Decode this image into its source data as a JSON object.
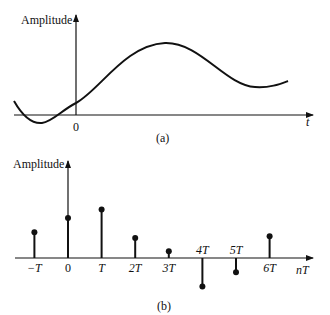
{
  "figure_a": {
    "y_axis_label": "Amplitude",
    "x_axis_label": "t",
    "origin_label": "0",
    "caption": "(a)",
    "description": "continuous-time analog signal"
  },
  "figure_b": {
    "y_axis_label": "Amplitude",
    "x_axis_label": "nT",
    "caption": "(b)",
    "description": "sampled discrete-time signal",
    "samples": [
      {
        "label": "−T",
        "n": -1,
        "value": 0.45
      },
      {
        "label": "0",
        "n": 0,
        "value": 0.7
      },
      {
        "label": "T",
        "n": 1,
        "value": 0.85
      },
      {
        "label": "2T",
        "n": 2,
        "value": 0.35
      },
      {
        "label": "3T",
        "n": 3,
        "value": 0.12
      },
      {
        "label": "4T",
        "n": 4,
        "value": -0.5
      },
      {
        "label": "5T",
        "n": 5,
        "value": -0.25
      },
      {
        "label": "6T",
        "n": 6,
        "value": 0.38
      }
    ]
  },
  "colors": {
    "ink": "#111111",
    "background": "#ffffff"
  }
}
